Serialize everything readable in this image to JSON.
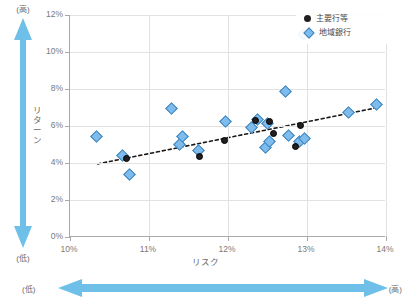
{
  "chart_data": {
    "type": "scatter",
    "title": "",
    "xlabel": "リスク",
    "ylabel": "リターン",
    "xlim": [
      10,
      14
    ],
    "ylim": [
      0,
      12
    ],
    "xticks": [
      "10%",
      "11%",
      "12%",
      "13%",
      "14%"
    ],
    "yticks": [
      "0%",
      "2%",
      "4%",
      "6%",
      "8%",
      "10%",
      "12%"
    ],
    "xtick_values": [
      10,
      11,
      12,
      13,
      14
    ],
    "ytick_values": [
      0,
      2,
      4,
      6,
      8,
      10,
      12
    ],
    "grid": true,
    "legend_position": "top-right",
    "series": [
      {
        "name": "主要行等",
        "marker": "circle",
        "color": "#231f20",
        "points": [
          {
            "x": 10.72,
            "y": 4.22
          },
          {
            "x": 11.64,
            "y": 4.37
          },
          {
            "x": 11.95,
            "y": 5.2
          },
          {
            "x": 12.35,
            "y": 6.28
          },
          {
            "x": 12.52,
            "y": 6.22
          },
          {
            "x": 12.57,
            "y": 5.62
          },
          {
            "x": 12.86,
            "y": 4.87
          },
          {
            "x": 12.92,
            "y": 6.05
          }
        ]
      },
      {
        "name": "地域銀行",
        "marker": "diamond",
        "color": "#7dbced",
        "points": [
          {
            "x": 10.33,
            "y": 5.42
          },
          {
            "x": 10.66,
            "y": 4.42
          },
          {
            "x": 10.75,
            "y": 3.36
          },
          {
            "x": 11.28,
            "y": 6.92
          },
          {
            "x": 11.38,
            "y": 5.02
          },
          {
            "x": 11.42,
            "y": 5.45
          },
          {
            "x": 11.63,
            "y": 4.68
          },
          {
            "x": 11.97,
            "y": 6.27
          },
          {
            "x": 12.3,
            "y": 5.9
          },
          {
            "x": 12.37,
            "y": 6.35
          },
          {
            "x": 12.5,
            "y": 6.12
          },
          {
            "x": 12.48,
            "y": 4.85
          },
          {
            "x": 12.53,
            "y": 5.17
          },
          {
            "x": 12.73,
            "y": 7.85
          },
          {
            "x": 12.76,
            "y": 5.47
          },
          {
            "x": 12.9,
            "y": 5.18
          },
          {
            "x": 12.97,
            "y": 5.35
          },
          {
            "x": 12.96,
            "y": 10.92
          },
          {
            "x": 13.52,
            "y": 6.73
          },
          {
            "x": 13.88,
            "y": 7.15
          }
        ]
      }
    ],
    "trendline": {
      "style": "dotted",
      "color": "#1a1a1a",
      "x_start": 10.35,
      "y_start": 3.95,
      "x_end": 13.92,
      "y_end": 7.02
    }
  },
  "annotations": {
    "vertical_axis": {
      "label": "リターン",
      "high": "(高)",
      "low": "(低)",
      "arrow_color": "#6fc0e8"
    },
    "horizontal_axis": {
      "label": "リスク",
      "high": "(高)",
      "low": "(低)",
      "arrow_color": "#6fc0e8"
    }
  },
  "legend": {
    "items": [
      {
        "label": "主要行等",
        "marker": "circle"
      },
      {
        "label": "地域銀行",
        "marker": "diamond"
      }
    ]
  }
}
